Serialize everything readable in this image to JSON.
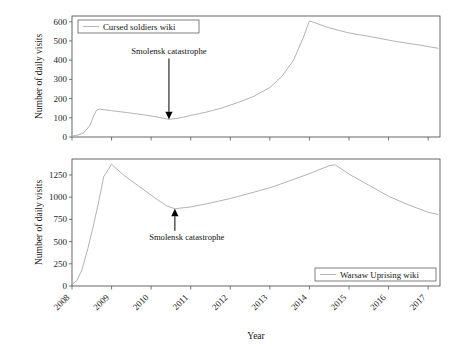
{
  "figure": {
    "background_color": "#ffffff",
    "line_color": "#b3b3b3",
    "frame_color": "#555555",
    "annotation_color": "#000000",
    "xlabel": "Year",
    "x_tick_labels": [
      "2008",
      "2009",
      "2010",
      "2011",
      "2012",
      "2013",
      "2014",
      "2015",
      "2016",
      "2017"
    ]
  },
  "chart_data": [
    {
      "type": "line",
      "panel": "top",
      "title": "",
      "xlabel": "",
      "ylabel": "Number of daily visits",
      "legend": [
        "Cursed soldiers wiki"
      ],
      "legend_position": "top-left",
      "grid": false,
      "xlim": [
        2008.0,
        2017.3
      ],
      "ylim": [
        0,
        630
      ],
      "x_ticks": [
        2008,
        2009,
        2010,
        2011,
        2012,
        2013,
        2014,
        2015,
        2016,
        2017
      ],
      "y_ticks": [
        0,
        100,
        200,
        300,
        400,
        500,
        600
      ],
      "y_tick_labels": [
        "0",
        "100",
        "200",
        "300",
        "400",
        "500",
        "600"
      ],
      "series": [
        {
          "name": "Cursed soldiers wiki",
          "x": [
            2008.0,
            2008.15,
            2008.3,
            2008.45,
            2008.55,
            2008.62,
            2008.7,
            2009.0,
            2009.4,
            2009.8,
            2010.1,
            2010.3,
            2010.45,
            2010.7,
            2011.0,
            2011.4,
            2011.8,
            2012.2,
            2012.6,
            2013.0,
            2013.3,
            2013.6,
            2013.85,
            2014.0,
            2014.5,
            2015.0,
            2015.6,
            2016.2,
            2016.8,
            2017.25
          ],
          "y": [
            5,
            10,
            22,
            60,
            110,
            140,
            145,
            137,
            127,
            116,
            106,
            98,
            92,
            98,
            112,
            130,
            152,
            180,
            212,
            258,
            315,
            400,
            520,
            605,
            568,
            542,
            520,
            497,
            478,
            462
          ]
        }
      ],
      "annotations": [
        {
          "text": "Smolensk catastrophe",
          "arrow_direction": "down",
          "target_x": 2010.45,
          "target_y": 92,
          "label_x": 2010.45,
          "label_y": 430
        }
      ]
    },
    {
      "type": "line",
      "panel": "bottom",
      "title": "",
      "xlabel": "Year",
      "ylabel": "Number of daily visits",
      "legend": [
        "Warsaw Uprising wiki"
      ],
      "legend_position": "bottom-right",
      "grid": false,
      "xlim": [
        2008.0,
        2017.3
      ],
      "ylim": [
        0,
        1430
      ],
      "x_ticks": [
        2008,
        2009,
        2010,
        2011,
        2012,
        2013,
        2014,
        2015,
        2016,
        2017
      ],
      "y_ticks": [
        0,
        250,
        500,
        750,
        1000,
        1250
      ],
      "y_tick_labels": [
        "0",
        "250",
        "500",
        "750",
        "1000",
        "1250"
      ],
      "series": [
        {
          "name": "Warsaw Uprising wiki",
          "x": [
            2008.0,
            2008.12,
            2008.25,
            2008.4,
            2008.55,
            2008.68,
            2008.8,
            2009.0,
            2009.3,
            2009.7,
            2010.1,
            2010.4,
            2010.6,
            2011.0,
            2011.5,
            2012.0,
            2012.5,
            2013.0,
            2013.5,
            2014.0,
            2014.5,
            2014.65,
            2015.0,
            2015.5,
            2016.0,
            2016.5,
            2017.0,
            2017.25
          ],
          "y": [
            20,
            60,
            180,
            420,
            700,
            960,
            1230,
            1370,
            1250,
            1120,
            990,
            900,
            870,
            890,
            935,
            985,
            1045,
            1105,
            1185,
            1265,
            1355,
            1365,
            1260,
            1135,
            1010,
            915,
            830,
            805
          ]
        }
      ],
      "annotations": [
        {
          "text": "Smolensk catastrophe",
          "arrow_direction": "up",
          "target_x": 2010.6,
          "target_y": 870,
          "label_x": 2010.9,
          "label_y": 520
        }
      ]
    }
  ]
}
